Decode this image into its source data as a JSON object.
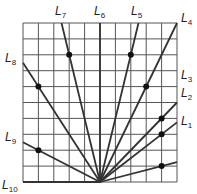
{
  "diagram": {
    "grid": {
      "cols": 10,
      "rows": 10,
      "left": 23,
      "top": 23,
      "right": 177,
      "bottom": 182,
      "color": "#555555"
    },
    "origin": [
      5,
      0
    ],
    "lines": [
      {
        "name": "L1",
        "end": [
          10,
          1.25
        ],
        "dot": [
          9,
          1
        ],
        "label_pos": [
          181,
          125
        ]
      },
      {
        "name": "L2",
        "end": [
          10,
          3.75
        ],
        "dot": [
          9,
          3
        ],
        "label_pos": [
          181,
          97
        ]
      },
      {
        "name": "L3",
        "end": [
          10,
          5
        ],
        "dot": [
          9,
          4
        ],
        "label_pos": [
          181,
          79
        ]
      },
      {
        "name": "L4",
        "end": [
          10,
          10
        ],
        "dot": [
          8,
          6
        ],
        "label_pos": [
          181,
          22
        ]
      },
      {
        "name": "L5",
        "end": [
          7.5,
          10
        ],
        "dot": [
          7,
          8
        ],
        "label_pos": [
          131,
          15
        ]
      },
      {
        "name": "L6",
        "end": [
          5,
          10
        ],
        "dot": null,
        "label_pos": [
          94,
          15
        ]
      },
      {
        "name": "L7",
        "end": [
          2.5,
          10
        ],
        "dot": [
          3,
          8
        ],
        "label_pos": [
          55,
          15
        ]
      },
      {
        "name": "L8",
        "end": [
          0,
          7.5
        ],
        "dot": [
          1,
          6
        ],
        "label_pos": [
          5,
          62
        ]
      },
      {
        "name": "L9",
        "end": [
          0,
          2.5
        ],
        "dot": [
          1,
          2
        ],
        "label_pos": [
          5,
          141
        ]
      },
      {
        "name": "L10",
        "end": [
          0,
          0
        ],
        "dot": null,
        "label_pos": [
          2,
          189
        ]
      }
    ]
  }
}
